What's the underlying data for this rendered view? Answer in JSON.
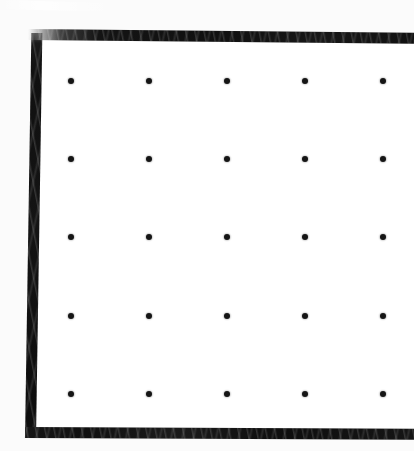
{
  "image": {
    "kind": "scanned-dot-grid-page",
    "width": 414,
    "height": 451,
    "background_color": "#fbfbfb",
    "paper_color": "#ffffff",
    "ink_color": "#121212"
  },
  "frame": {
    "label": "printed page border",
    "visible_sides": [
      "left",
      "top",
      "bottom"
    ],
    "cropped_sides": [
      "right"
    ],
    "stroke_color": "#121212",
    "stroke_thickness_px": 11,
    "left": {
      "x": 25,
      "y": 33,
      "width": 11,
      "height": 405
    },
    "top": {
      "x": 28,
      "y": 29,
      "width": 386,
      "height": 11
    },
    "bottom": {
      "x": 25,
      "y": 427,
      "width": 389,
      "height": 11
    }
  },
  "dot_grid": {
    "label": "dot grid",
    "rows": 5,
    "columns": 5,
    "dot_count": 25,
    "dot_diameter_px": 6,
    "dot_color": "#151515",
    "column_x": [
      71,
      149,
      227,
      305,
      383
    ],
    "row_y": [
      81,
      159,
      237,
      316,
      394
    ],
    "column_spacing_px": 78,
    "row_spacing_px": 78,
    "dots": [
      {
        "row": 0,
        "col": 0,
        "x": 71,
        "y": 81
      },
      {
        "row": 0,
        "col": 1,
        "x": 149,
        "y": 81
      },
      {
        "row": 0,
        "col": 2,
        "x": 227,
        "y": 81
      },
      {
        "row": 0,
        "col": 3,
        "x": 305,
        "y": 81
      },
      {
        "row": 0,
        "col": 4,
        "x": 383,
        "y": 81
      },
      {
        "row": 1,
        "col": 0,
        "x": 71,
        "y": 159
      },
      {
        "row": 1,
        "col": 1,
        "x": 149,
        "y": 159
      },
      {
        "row": 1,
        "col": 2,
        "x": 227,
        "y": 159
      },
      {
        "row": 1,
        "col": 3,
        "x": 305,
        "y": 159
      },
      {
        "row": 1,
        "col": 4,
        "x": 383,
        "y": 159
      },
      {
        "row": 2,
        "col": 0,
        "x": 71,
        "y": 237
      },
      {
        "row": 2,
        "col": 1,
        "x": 149,
        "y": 237
      },
      {
        "row": 2,
        "col": 2,
        "x": 227,
        "y": 237
      },
      {
        "row": 2,
        "col": 3,
        "x": 305,
        "y": 237
      },
      {
        "row": 2,
        "col": 4,
        "x": 383,
        "y": 237
      },
      {
        "row": 3,
        "col": 0,
        "x": 71,
        "y": 316
      },
      {
        "row": 3,
        "col": 1,
        "x": 149,
        "y": 316
      },
      {
        "row": 3,
        "col": 2,
        "x": 227,
        "y": 316
      },
      {
        "row": 3,
        "col": 3,
        "x": 305,
        "y": 316
      },
      {
        "row": 3,
        "col": 4,
        "x": 383,
        "y": 316
      },
      {
        "row": 4,
        "col": 0,
        "x": 71,
        "y": 394
      },
      {
        "row": 4,
        "col": 1,
        "x": 149,
        "y": 394
      },
      {
        "row": 4,
        "col": 2,
        "x": 227,
        "y": 394
      },
      {
        "row": 4,
        "col": 3,
        "x": 305,
        "y": 394
      },
      {
        "row": 4,
        "col": 4,
        "x": 383,
        "y": 394
      }
    ]
  },
  "text": {
    "has_text": false,
    "strings": []
  }
}
